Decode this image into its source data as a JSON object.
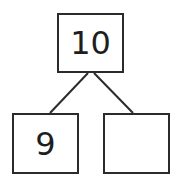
{
  "number_bond": {
    "whole": "10",
    "parts": [
      {
        "label": "9"
      },
      {
        "label": ""
      }
    ]
  },
  "colors": {
    "stroke": "#2b2b2b",
    "text": "#1e1e1e",
    "background": "#ffffff"
  }
}
